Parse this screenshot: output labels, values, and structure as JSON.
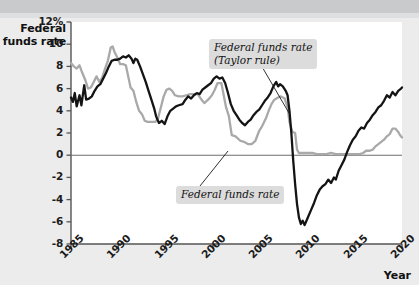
{
  "figure": {
    "y_axis_title_line1": "Federal",
    "y_axis_title_line2": "funds rate",
    "x_axis_title": "Year",
    "annotations": {
      "taylor": "Federal funds rate\n(Taylor rule)",
      "actual": "Federal funds rate"
    },
    "colors": {
      "taylor_rule_line": "#141414",
      "actual_rate_line": "#a9a9a9",
      "plot_background": "#ffffff",
      "page_background": "#ececed",
      "top_band": "#c9cacb",
      "axis": "#555555",
      "callout_background": "#dcdcdc"
    }
  },
  "chart_data": {
    "type": "line",
    "title": "",
    "xlabel": "Year",
    "ylabel": "Federal funds rate",
    "xlim": [
      1985,
      2020
    ],
    "ylim": [
      -8,
      12
    ],
    "ytick_labels": [
      "12%",
      "10",
      "8",
      "6",
      "4",
      "2",
      "0",
      "-2",
      "-4",
      "-6",
      "-8"
    ],
    "ytick_values": [
      12,
      10,
      8,
      6,
      4,
      2,
      0,
      -2,
      -4,
      -6,
      -8
    ],
    "xtick_labels": [
      "1985",
      "1990",
      "1995",
      "2000",
      "2005",
      "2010",
      "2015",
      "2020"
    ],
    "xtick_values": [
      1985,
      1990,
      1995,
      2000,
      2005,
      2010,
      2015,
      2020
    ],
    "grid": false,
    "zero_line": true,
    "legend": "annotations",
    "series": [
      {
        "name": "Federal funds rate (Taylor rule)",
        "color": "#141414",
        "points": [
          [
            1985.0,
            5.2
          ],
          [
            1985.2,
            4.8
          ],
          [
            1985.4,
            5.6
          ],
          [
            1985.6,
            4.4
          ],
          [
            1985.9,
            5.4
          ],
          [
            1986.1,
            4.5
          ],
          [
            1986.4,
            6.3
          ],
          [
            1986.6,
            5.0
          ],
          [
            1986.9,
            5.1
          ],
          [
            1987.2,
            5.3
          ],
          [
            1987.5,
            5.8
          ],
          [
            1987.8,
            6.2
          ],
          [
            1988.1,
            6.4
          ],
          [
            1988.4,
            6.9
          ],
          [
            1988.7,
            7.4
          ],
          [
            1989.0,
            8.0
          ],
          [
            1989.3,
            8.5
          ],
          [
            1989.6,
            8.6
          ],
          [
            1989.9,
            8.6
          ],
          [
            1990.2,
            8.7
          ],
          [
            1990.5,
            8.9
          ],
          [
            1990.8,
            8.8
          ],
          [
            1991.1,
            9.0
          ],
          [
            1991.4,
            8.7
          ],
          [
            1991.6,
            8.3
          ],
          [
            1991.8,
            8.7
          ],
          [
            1992.0,
            8.6
          ],
          [
            1992.3,
            8.0
          ],
          [
            1992.6,
            7.3
          ],
          [
            1992.9,
            6.6
          ],
          [
            1993.2,
            5.8
          ],
          [
            1993.5,
            5.0
          ],
          [
            1993.8,
            4.2
          ],
          [
            1994.0,
            3.5
          ],
          [
            1994.3,
            2.9
          ],
          [
            1994.6,
            3.1
          ],
          [
            1994.9,
            2.8
          ],
          [
            1995.2,
            3.5
          ],
          [
            1995.5,
            4.0
          ],
          [
            1995.8,
            4.2
          ],
          [
            1996.1,
            4.4
          ],
          [
            1996.4,
            4.5
          ],
          [
            1996.8,
            4.6
          ],
          [
            1997.1,
            5.0
          ],
          [
            1997.4,
            5.3
          ],
          [
            1997.7,
            5.1
          ],
          [
            1998.0,
            5.4
          ],
          [
            1998.3,
            5.6
          ],
          [
            1998.6,
            5.5
          ],
          [
            1998.9,
            5.9
          ],
          [
            1999.2,
            6.1
          ],
          [
            1999.5,
            6.3
          ],
          [
            1999.8,
            6.5
          ],
          [
            2000.1,
            6.9
          ],
          [
            2000.4,
            7.1
          ],
          [
            2000.7,
            6.9
          ],
          [
            2001.0,
            7.0
          ],
          [
            2001.3,
            6.5
          ],
          [
            2001.6,
            5.6
          ],
          [
            2001.9,
            4.6
          ],
          [
            2002.2,
            4.0
          ],
          [
            2002.5,
            3.6
          ],
          [
            2002.8,
            3.2
          ],
          [
            2003.1,
            2.9
          ],
          [
            2003.4,
            2.7
          ],
          [
            2003.7,
            3.0
          ],
          [
            2004.0,
            3.2
          ],
          [
            2004.3,
            3.6
          ],
          [
            2004.6,
            3.9
          ],
          [
            2004.9,
            4.1
          ],
          [
            2005.2,
            4.5
          ],
          [
            2005.5,
            4.9
          ],
          [
            2005.8,
            5.2
          ],
          [
            2006.1,
            5.6
          ],
          [
            2006.4,
            6.2
          ],
          [
            2006.7,
            6.6
          ],
          [
            2006.9,
            6.2
          ],
          [
            2007.1,
            6.4
          ],
          [
            2007.4,
            6.2
          ],
          [
            2007.7,
            5.8
          ],
          [
            2007.9,
            5.4
          ],
          [
            2008.1,
            4.0
          ],
          [
            2008.3,
            2.0
          ],
          [
            2008.5,
            -0.5
          ],
          [
            2008.7,
            -2.6
          ],
          [
            2008.9,
            -4.4
          ],
          [
            2009.1,
            -5.6
          ],
          [
            2009.3,
            -6.2
          ],
          [
            2009.5,
            -5.9
          ],
          [
            2009.7,
            -6.3
          ],
          [
            2009.9,
            -5.9
          ],
          [
            2010.1,
            -5.5
          ],
          [
            2010.4,
            -4.9
          ],
          [
            2010.7,
            -4.3
          ],
          [
            2011.0,
            -3.6
          ],
          [
            2011.3,
            -3.1
          ],
          [
            2011.6,
            -2.8
          ],
          [
            2011.9,
            -2.6
          ],
          [
            2012.2,
            -2.2
          ],
          [
            2012.5,
            -2.5
          ],
          [
            2012.8,
            -2.0
          ],
          [
            2013.0,
            -2.2
          ],
          [
            2013.3,
            -1.4
          ],
          [
            2013.6,
            -0.9
          ],
          [
            2013.9,
            -0.4
          ],
          [
            2014.2,
            0.3
          ],
          [
            2014.5,
            0.9
          ],
          [
            2014.8,
            1.4
          ],
          [
            2015.1,
            1.7
          ],
          [
            2015.4,
            2.2
          ],
          [
            2015.7,
            2.5
          ],
          [
            2016.0,
            2.4
          ],
          [
            2016.3,
            2.9
          ],
          [
            2016.6,
            3.2
          ],
          [
            2016.9,
            3.6
          ],
          [
            2017.2,
            3.9
          ],
          [
            2017.5,
            4.3
          ],
          [
            2017.8,
            4.5
          ],
          [
            2018.1,
            4.9
          ],
          [
            2018.4,
            5.4
          ],
          [
            2018.7,
            5.2
          ],
          [
            2019.0,
            5.7
          ],
          [
            2019.3,
            5.4
          ],
          [
            2019.6,
            5.8
          ],
          [
            2019.9,
            6.0
          ],
          [
            2020.0,
            6.1
          ]
        ]
      },
      {
        "name": "Federal funds rate",
        "color": "#a9a9a9",
        "points": [
          [
            1985.0,
            8.3
          ],
          [
            1985.3,
            8.0
          ],
          [
            1985.6,
            7.8
          ],
          [
            1985.9,
            8.1
          ],
          [
            1986.2,
            7.4
          ],
          [
            1986.5,
            6.8
          ],
          [
            1986.8,
            6.0
          ],
          [
            1987.1,
            6.1
          ],
          [
            1987.4,
            6.6
          ],
          [
            1987.7,
            7.1
          ],
          [
            1988.0,
            6.6
          ],
          [
            1988.3,
            7.0
          ],
          [
            1988.6,
            7.8
          ],
          [
            1988.9,
            8.5
          ],
          [
            1989.2,
            9.7
          ],
          [
            1989.4,
            9.8
          ],
          [
            1989.6,
            9.3
          ],
          [
            1989.9,
            8.8
          ],
          [
            1990.2,
            8.2
          ],
          [
            1990.5,
            8.2
          ],
          [
            1990.8,
            8.1
          ],
          [
            1991.0,
            7.3
          ],
          [
            1991.3,
            6.1
          ],
          [
            1991.6,
            5.8
          ],
          [
            1991.9,
            4.8
          ],
          [
            1992.2,
            4.0
          ],
          [
            1992.5,
            3.7
          ],
          [
            1992.8,
            3.1
          ],
          [
            1993.1,
            3.0
          ],
          [
            1993.5,
            3.0
          ],
          [
            1993.9,
            3.0
          ],
          [
            1994.2,
            3.3
          ],
          [
            1994.5,
            4.3
          ],
          [
            1994.8,
            5.3
          ],
          [
            1995.1,
            5.9
          ],
          [
            1995.4,
            6.0
          ],
          [
            1995.7,
            5.8
          ],
          [
            1996.0,
            5.4
          ],
          [
            1996.4,
            5.3
          ],
          [
            1996.8,
            5.3
          ],
          [
            1997.2,
            5.4
          ],
          [
            1997.6,
            5.5
          ],
          [
            1998.0,
            5.5
          ],
          [
            1998.4,
            5.5
          ],
          [
            1998.8,
            5.0
          ],
          [
            1999.1,
            4.7
          ],
          [
            1999.5,
            5.0
          ],
          [
            1999.9,
            5.4
          ],
          [
            2000.2,
            5.9
          ],
          [
            2000.5,
            6.5
          ],
          [
            2000.9,
            6.5
          ],
          [
            2001.1,
            5.6
          ],
          [
            2001.4,
            4.3
          ],
          [
            2001.7,
            3.5
          ],
          [
            2002.0,
            1.8
          ],
          [
            2002.4,
            1.7
          ],
          [
            2002.9,
            1.3
          ],
          [
            2003.3,
            1.2
          ],
          [
            2003.7,
            1.0
          ],
          [
            2004.1,
            1.0
          ],
          [
            2004.5,
            1.3
          ],
          [
            2004.9,
            2.2
          ],
          [
            2005.2,
            2.6
          ],
          [
            2005.6,
            3.3
          ],
          [
            2005.9,
            4.0
          ],
          [
            2006.2,
            4.6
          ],
          [
            2006.5,
            5.0
          ],
          [
            2006.9,
            5.2
          ],
          [
            2007.2,
            5.3
          ],
          [
            2007.6,
            5.1
          ],
          [
            2007.9,
            4.3
          ],
          [
            2008.1,
            3.0
          ],
          [
            2008.4,
            2.1
          ],
          [
            2008.7,
            2.0
          ],
          [
            2008.9,
            0.5
          ],
          [
            2009.1,
            0.2
          ],
          [
            2009.5,
            0.2
          ],
          [
            2010.0,
            0.2
          ],
          [
            2010.5,
            0.2
          ],
          [
            2011.0,
            0.1
          ],
          [
            2011.5,
            0.1
          ],
          [
            2012.0,
            0.1
          ],
          [
            2012.5,
            0.2
          ],
          [
            2013.0,
            0.1
          ],
          [
            2013.5,
            0.1
          ],
          [
            2014.0,
            0.1
          ],
          [
            2014.5,
            0.1
          ],
          [
            2015.0,
            0.1
          ],
          [
            2015.5,
            0.1
          ],
          [
            2015.9,
            0.2
          ],
          [
            2016.2,
            0.4
          ],
          [
            2016.6,
            0.4
          ],
          [
            2016.9,
            0.5
          ],
          [
            2017.2,
            0.8
          ],
          [
            2017.5,
            1.0
          ],
          [
            2017.8,
            1.2
          ],
          [
            2018.1,
            1.4
          ],
          [
            2018.4,
            1.7
          ],
          [
            2018.7,
            1.9
          ],
          [
            2019.0,
            2.4
          ],
          [
            2019.3,
            2.4
          ],
          [
            2019.6,
            2.1
          ],
          [
            2019.8,
            1.8
          ],
          [
            2020.0,
            1.6
          ]
        ]
      }
    ]
  }
}
